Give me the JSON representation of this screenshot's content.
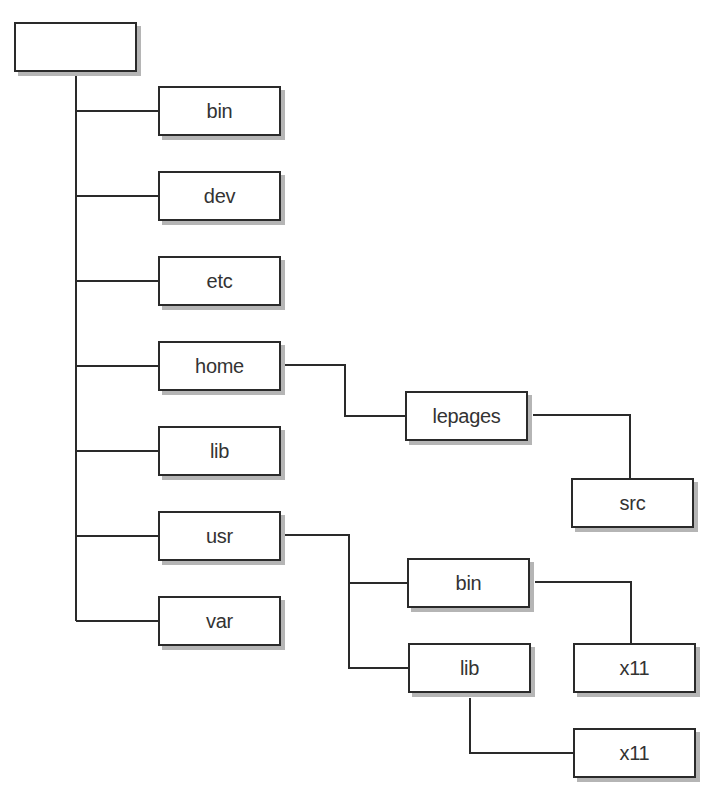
{
  "diagram": {
    "type": "directory-tree",
    "line_color": "#2a2a2a",
    "shadow_color": "#b5b5b5",
    "root": {
      "label": ""
    },
    "nodes": [
      {
        "id": "root",
        "label": "",
        "parent": null,
        "x": 14,
        "y": 22
      },
      {
        "id": "bin",
        "label": "bin",
        "parent": "root",
        "x": 158,
        "y": 86
      },
      {
        "id": "dev",
        "label": "dev",
        "parent": "root",
        "x": 158,
        "y": 171
      },
      {
        "id": "etc",
        "label": "etc",
        "parent": "root",
        "x": 158,
        "y": 256
      },
      {
        "id": "home",
        "label": "home",
        "parent": "root",
        "x": 158,
        "y": 341
      },
      {
        "id": "lib",
        "label": "lib",
        "parent": "root",
        "x": 158,
        "y": 426
      },
      {
        "id": "usr",
        "label": "usr",
        "parent": "root",
        "x": 158,
        "y": 511
      },
      {
        "id": "var",
        "label": "var",
        "parent": "root",
        "x": 158,
        "y": 596
      },
      {
        "id": "lepages",
        "label": "lepages",
        "parent": "home",
        "x": 405,
        "y": 391
      },
      {
        "id": "src",
        "label": "src",
        "parent": "lepages",
        "x": 571,
        "y": 478
      },
      {
        "id": "usr-bin",
        "label": "bin",
        "parent": "usr",
        "x": 407,
        "y": 558
      },
      {
        "id": "usr-lib",
        "label": "lib",
        "parent": "usr",
        "x": 408,
        "y": 643
      },
      {
        "id": "bin-x11",
        "label": "x11",
        "parent": "usr-bin",
        "x": 573,
        "y": 643
      },
      {
        "id": "lib-x11",
        "label": "x11",
        "parent": "usr-lib",
        "x": 573,
        "y": 728
      }
    ]
  }
}
